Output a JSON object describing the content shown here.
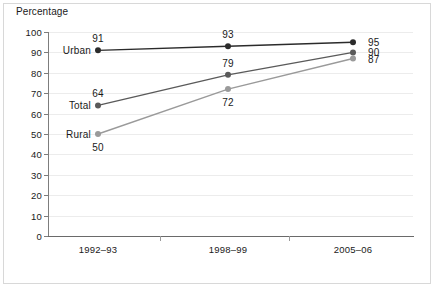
{
  "chart_data": {
    "type": "line",
    "title": "",
    "ylabel": "Percentage",
    "xlabel": "",
    "categories": [
      "1992–93",
      "1998–99",
      "2005–06"
    ],
    "ylim": [
      0,
      100
    ],
    "y_ticks": [
      "0",
      "10",
      "20",
      "30",
      "40",
      "50",
      "60",
      "70",
      "80",
      "90",
      "100"
    ],
    "grid": true,
    "legend": "inline-series-labels",
    "series": [
      {
        "name": "Urban",
        "values": [
          91,
          93,
          95
        ],
        "color": "#2b2b2b",
        "point_labels": [
          "91",
          "93",
          "95"
        ]
      },
      {
        "name": "Total",
        "values": [
          64,
          79,
          90
        ],
        "color": "#5a5a5a",
        "point_labels": [
          "64",
          "79",
          "90"
        ]
      },
      {
        "name": "Rural",
        "values": [
          50,
          72,
          87
        ],
        "color": "#9a9a9a",
        "point_labels": [
          "50",
          "72",
          "87"
        ]
      }
    ]
  },
  "axis": {
    "y_title": "Percentage"
  },
  "colors": {
    "urban": "#2b2b2b",
    "total": "#5a5a5a",
    "rural": "#9a9a9a",
    "grid": "#ececec",
    "axis": "#6a6a6a",
    "frame": "#d8d8d8",
    "text": "#1a1a1a"
  }
}
